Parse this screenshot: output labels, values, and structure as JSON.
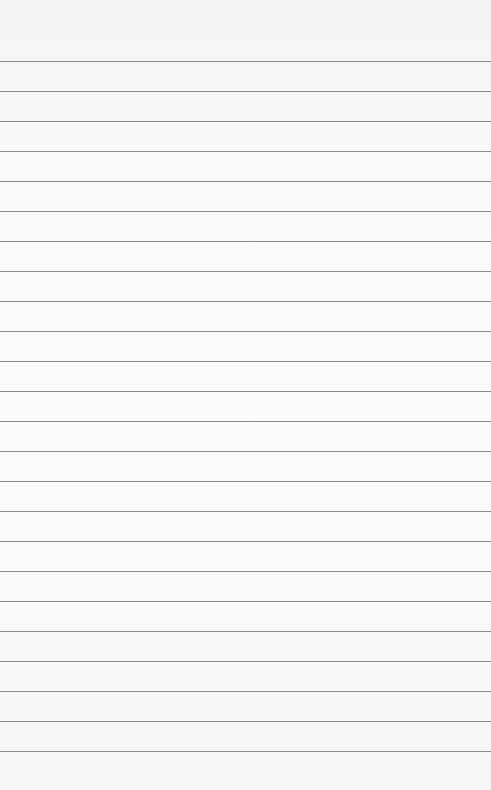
{
  "paper": {
    "background": "#f8f8f8",
    "line_color": "#8a8a8a",
    "first_line_y": 61,
    "line_spacing": 30,
    "line_count": 24
  }
}
